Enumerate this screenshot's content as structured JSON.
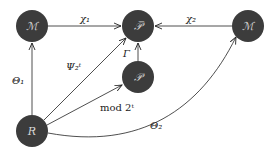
{
  "diagram": {
    "colors": {
      "node_fill": "#3c3c3c",
      "node_text": "#d8d8d8",
      "edge": "#222222",
      "background": "#ffffff"
    },
    "nodes": [
      {
        "id": "M1",
        "label": "ℳ",
        "x": 32,
        "y": 26
      },
      {
        "id": "Pbar",
        "label": "𝒫̅",
        "x": 138,
        "y": 26
      },
      {
        "id": "M2",
        "label": "ℳ",
        "x": 248,
        "y": 26
      },
      {
        "id": "P",
        "label": "𝒫",
        "x": 138,
        "y": 77
      },
      {
        "id": "R",
        "label": "R",
        "x": 32,
        "y": 131
      }
    ],
    "edges": [
      {
        "from": "M1",
        "to": "Pbar",
        "label": "χ₁"
      },
      {
        "from": "M2",
        "to": "Pbar",
        "label": "χ₂"
      },
      {
        "from": "R",
        "to": "M1",
        "label": "Θ₁"
      },
      {
        "from": "R",
        "to": "Pbar",
        "label": "Ψ₂ᵗ"
      },
      {
        "from": "P",
        "to": "Pbar",
        "label": "Γ"
      },
      {
        "from": "R",
        "to": "P",
        "label": "mod 2ᵗ"
      },
      {
        "from": "R",
        "to": "M2",
        "label": "Θ₂"
      }
    ]
  }
}
